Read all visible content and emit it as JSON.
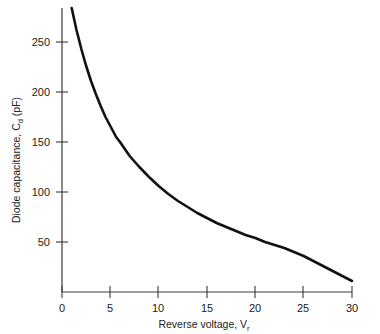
{
  "chart_data": {
    "type": "line",
    "title": "",
    "xlabel": "Reverse voltage, V",
    "xlabel_sub": "r",
    "ylabel": "Diode capacitance, C",
    "ylabel_sub": "d",
    "ylabel_unit": " (pF)",
    "xlim": [
      0,
      30
    ],
    "ylim": [
      0,
      285
    ],
    "xticks": [
      0,
      5,
      10,
      15,
      20,
      25,
      30
    ],
    "xtick_labels": [
      "0",
      "5",
      "10",
      "15",
      "20",
      "25",
      "30"
    ],
    "yticks": [
      50,
      100,
      150,
      200,
      250
    ],
    "ytick_labels": [
      "50",
      "100",
      "150",
      "200",
      "250"
    ],
    "grid": false,
    "legend": false,
    "series": [
      {
        "name": "Diode capacitance vs reverse voltage",
        "color": "#111111",
        "x": [
          1.0,
          1.5,
          2.0,
          2.5,
          3.0,
          3.5,
          4.0,
          4.5,
          5.0,
          5.6,
          6.0,
          7.0,
          8.0,
          9.0,
          10.0,
          11.0,
          12.0,
          13.0,
          14.0,
          15.0,
          16.0,
          17.0,
          18.0,
          19.0,
          20.0,
          21.0,
          22.0,
          23.0,
          24.0,
          25.0,
          26.0,
          27.0,
          28.0,
          29.0,
          30.0
        ],
        "y": [
          284,
          262,
          243,
          226,
          211,
          198,
          186,
          175,
          166,
          155,
          150,
          136,
          125,
          115,
          106,
          98,
          91,
          85,
          79,
          74,
          69,
          65,
          61,
          57,
          54,
          50,
          47,
          44,
          40,
          36,
          31,
          26,
          21,
          16,
          11
        ]
      }
    ]
  }
}
